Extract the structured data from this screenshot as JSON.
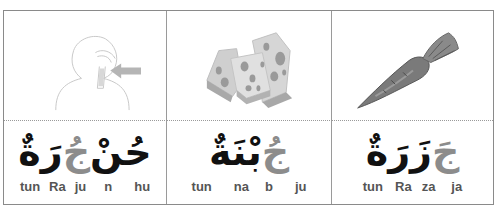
{
  "cards": [
    {
      "picture": "throat-illustration-icon",
      "arabic_word_parts": {
        "black_start": "حُنْ",
        "gray_mid": "جُ",
        "black_end": "رَةٌ"
      },
      "syllables": [
        "tun",
        "Ra",
        "ju",
        "n",
        "hu"
      ]
    },
    {
      "picture": "cheese-illustration-icon",
      "arabic_word_parts": {
        "gray_start": "جُ",
        "black_end": "بْنَةٌ"
      },
      "syllables": [
        "tun",
        "na",
        "b",
        "ju"
      ]
    },
    {
      "picture": "carrot-illustration-icon",
      "arabic_word_parts": {
        "gray_start": "جَ",
        "black_end": "زَرَةٌ"
      },
      "syllables": [
        "tun",
        "Ra",
        "za",
        "ja"
      ]
    }
  ],
  "colors": {
    "ink": "#111111",
    "highlight": "#8c8c8c",
    "border": "#8a8a8a",
    "syllable_text": "#555555"
  }
}
